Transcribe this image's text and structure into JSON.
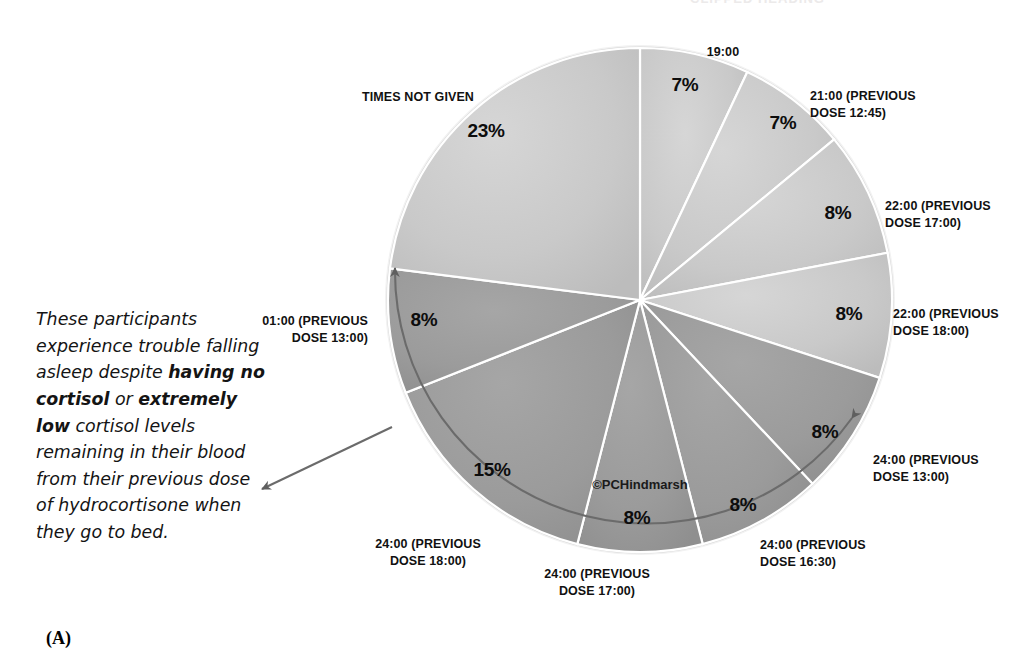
{
  "figure": {
    "letter": "(A)",
    "watermark": "©PCHindmarsh",
    "clipped_title": "CLIPPED HEADING"
  },
  "annotation": {
    "part1": "These participants experience trouble falling asleep despite ",
    "bold1": "having no cortisol",
    "part2": " or ",
    "bold2": "extremely low",
    "part3": " cortisol levels remaining in their blood from their previous dose of hydrocortisone when they go to bed.",
    "arrow": "leftward-arrow"
  },
  "chart_data": {
    "type": "pie",
    "title": "",
    "start_angle_deg": 0,
    "direction": "clockwise",
    "legend": "none",
    "colors": {
      "light_slice": "#c9c9c9",
      "dark_slice": "#9b9b9b",
      "slice_border": "#ffffff",
      "rim": "#ffffff",
      "annotation_arc": "#5a5a5a"
    },
    "categories": [
      "19:00",
      "21:00 (PREVIOUS DOSE 12:45)",
      "22:00 (PREVIOUS DOSE 17:00)",
      "22:00 (PREVIOUS DOSE 18:00)",
      "24:00 (PREVIOUS DOSE 13:00)",
      "24:00 (PREVIOUS DOSE 16:30)",
      "24:00 (PREVIOUS DOSE 17:00)",
      "24:00 (PREVIOUS DOSE 18:00)",
      "01:00 (PREVIOUS DOSE 13:00)",
      "TIMES NOT GIVEN"
    ],
    "values": [
      7,
      7,
      8,
      8,
      8,
      8,
      8,
      15,
      8,
      23
    ],
    "value_labels": [
      "7%",
      "7%",
      "8%",
      "8%",
      "8%",
      "8%",
      "8%",
      "15%",
      "8%",
      "23%"
    ],
    "slices": [
      {
        "label": "19:00",
        "value": 7,
        "label_text": "7%",
        "tone": "light",
        "label_line1": "19:00",
        "label_line2": "",
        "lx": 723,
        "ly": 44,
        "px": 685,
        "py": 85,
        "align": "c"
      },
      {
        "label": "21:00 (PREVIOUS DOSE 12:45)",
        "value": 7,
        "label_text": "7%",
        "tone": "light",
        "label_line1": "21:00 (PREVIOUS",
        "label_line2": "DOSE 12:45)",
        "lx": 810,
        "ly": 88,
        "px": 783,
        "py": 123,
        "align": "l"
      },
      {
        "label": "22:00 (PREVIOUS DOSE 17:00)",
        "value": 8,
        "label_text": "8%",
        "tone": "light",
        "label_line1": "22:00 (PREVIOUS",
        "label_line2": "DOSE 17:00)",
        "lx": 885,
        "ly": 198,
        "px": 838,
        "py": 213,
        "align": "l"
      },
      {
        "label": "22:00 (PREVIOUS DOSE 18:00)",
        "value": 8,
        "label_text": "8%",
        "tone": "light",
        "label_line1": "22:00 (PREVIOUS",
        "label_line2": "DOSE 18:00)",
        "lx": 893,
        "ly": 306,
        "px": 849,
        "py": 314,
        "align": "l"
      },
      {
        "label": "24:00 (PREVIOUS DOSE 13:00)",
        "value": 8,
        "label_text": "8%",
        "tone": "dark",
        "label_line1": "24:00 (PREVIOUS",
        "label_line2": "DOSE 13:00)",
        "lx": 873,
        "ly": 452,
        "px": 825,
        "py": 432,
        "align": "l"
      },
      {
        "label": "24:00 (PREVIOUS DOSE 16:30)",
        "value": 8,
        "label_text": "8%",
        "tone": "dark",
        "label_line1": "24:00 (PREVIOUS",
        "label_line2": "DOSE 16:30)",
        "lx": 760,
        "ly": 537,
        "px": 743,
        "py": 505,
        "align": "l"
      },
      {
        "label": "24:00 (PREVIOUS DOSE 17:00)",
        "value": 8,
        "label_text": "8%",
        "tone": "dark",
        "label_line1": "24:00 (PREVIOUS",
        "label_line2": "DOSE 17:00)",
        "lx": 597,
        "ly": 566,
        "px": 637,
        "py": 518,
        "align": "c"
      },
      {
        "label": "24:00 (PREVIOUS DOSE 18:00)",
        "value": 15,
        "label_text": "15%",
        "tone": "dark",
        "label_line1": "24:00 (PREVIOUS",
        "label_line2": "DOSE 18:00)",
        "lx": 428,
        "ly": 536,
        "px": 492,
        "py": 470,
        "align": "c"
      },
      {
        "label": "01:00 (PREVIOUS DOSE 13:00)",
        "value": 8,
        "label_text": "8%",
        "tone": "dark",
        "label_line1": "01:00 (PREVIOUS",
        "label_line2": "DOSE 13:00)",
        "lx": 368,
        "ly": 313,
        "px": 424,
        "py": 320,
        "align": "r"
      },
      {
        "label": "TIMES NOT GIVEN",
        "value": 23,
        "label_text": "23%",
        "tone": "light",
        "label_line1": "TIMES NOT GIVEN",
        "label_line2": "",
        "lx": 418,
        "ly": 89,
        "px": 486,
        "py": 131,
        "align": "c"
      }
    ]
  }
}
